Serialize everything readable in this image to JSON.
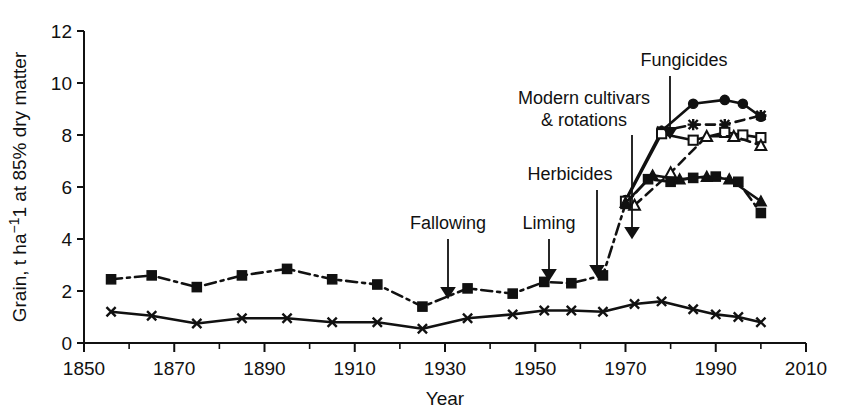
{
  "chart_data": {
    "type": "line",
    "title": "",
    "xlabel": "Year",
    "ylabel": "Grain, t ha−1 at 85% dry matter",
    "xlim": [
      1850,
      2010
    ],
    "ylim": [
      0,
      12
    ],
    "xticks": [
      1850,
      1870,
      1890,
      1910,
      1930,
      1950,
      1970,
      1990,
      2010
    ],
    "xtick_labels": [
      "1850",
      "1870",
      "1890",
      "1910",
      "1930",
      "1950",
      "1970",
      "1990",
      "2010"
    ],
    "xtick_minor_step": 10,
    "yticks": [
      0,
      2,
      4,
      6,
      8,
      10,
      12
    ],
    "ytick_labels": [
      "0",
      "2",
      "4",
      "6",
      "8",
      "10",
      "12"
    ],
    "grid": false,
    "legend": "none",
    "series": [
      {
        "name": "fym-treatment",
        "marker": "filled-square",
        "linestyle": "dashdot",
        "points": [
          [
            1856,
            2.45
          ],
          [
            1865,
            2.6
          ],
          [
            1875,
            2.15
          ],
          [
            1885,
            2.6
          ],
          [
            1895,
            2.85
          ],
          [
            1905,
            2.45
          ],
          [
            1915,
            2.25
          ],
          [
            1925,
            1.4
          ],
          [
            1935,
            2.1
          ],
          [
            1945,
            1.9
          ],
          [
            1952,
            2.35
          ],
          [
            1958,
            2.3
          ],
          [
            1965,
            2.6
          ],
          [
            1970,
            5.35
          ],
          [
            1975,
            6.3
          ],
          [
            1980,
            6.2
          ],
          [
            1985,
            6.35
          ],
          [
            1990,
            6.4
          ],
          [
            1995,
            6.2
          ],
          [
            2000,
            5.0
          ]
        ]
      },
      {
        "name": "unfertilized-control",
        "marker": "cross-x",
        "linestyle": "solid",
        "points": [
          [
            1856,
            1.2
          ],
          [
            1865,
            1.05
          ],
          [
            1875,
            0.75
          ],
          [
            1885,
            0.95
          ],
          [
            1895,
            0.95
          ],
          [
            1905,
            0.8
          ],
          [
            1915,
            0.8
          ],
          [
            1925,
            0.55
          ],
          [
            1935,
            0.95
          ],
          [
            1945,
            1.1
          ],
          [
            1952,
            1.25
          ],
          [
            1958,
            1.25
          ],
          [
            1965,
            1.2
          ],
          [
            1972,
            1.5
          ],
          [
            1978,
            1.6
          ],
          [
            1985,
            1.3
          ],
          [
            1990,
            1.1
          ],
          [
            1995,
            1.0
          ],
          [
            2000,
            0.8
          ]
        ]
      },
      {
        "name": "modern-cultivars-fungicide-top",
        "marker": "filled-circle",
        "linestyle": "solid",
        "points": [
          [
            1970,
            5.5
          ],
          [
            1978,
            8.15
          ],
          [
            1985,
            9.2
          ],
          [
            1992,
            9.35
          ],
          [
            1996,
            9.2
          ],
          [
            2000,
            8.7
          ]
        ]
      },
      {
        "name": "modern-cultivars-fungicide-alt",
        "marker": "asterisk",
        "linestyle": "dashed",
        "points": [
          [
            1978,
            8.15
          ],
          [
            1985,
            8.4
          ],
          [
            1992,
            8.4
          ],
          [
            2000,
            8.75
          ]
        ]
      },
      {
        "name": "modern-cultivars-no-fungicide",
        "marker": "open-square",
        "linestyle": "solid",
        "points": [
          [
            1970,
            5.45
          ],
          [
            1978,
            8.05
          ],
          [
            1985,
            7.8
          ],
          [
            1992,
            8.1
          ],
          [
            1996,
            8.0
          ],
          [
            2000,
            7.9
          ]
        ]
      },
      {
        "name": "modern-cultivars-no-fungicide-alt",
        "marker": "open-triangle",
        "linestyle": "dashed",
        "points": [
          [
            1972,
            5.3
          ],
          [
            1980,
            6.55
          ],
          [
            1988,
            7.95
          ],
          [
            1994,
            7.95
          ],
          [
            2000,
            7.6
          ]
        ]
      },
      {
        "name": "older-cultivars",
        "marker": "filled-triangle",
        "linestyle": "solid",
        "points": [
          [
            1970,
            5.4
          ],
          [
            1976,
            6.45
          ],
          [
            1982,
            6.3
          ],
          [
            1988,
            6.4
          ],
          [
            1993,
            6.3
          ],
          [
            2000,
            5.45
          ]
        ]
      }
    ],
    "annotations": [
      {
        "label": "Fallowing",
        "text_x": 448,
        "text_y": 229,
        "arrow_x": 448,
        "arrow_y0": 239,
        "arrow_y1": 300
      },
      {
        "label": "Liming",
        "text_x": 549,
        "text_y": 229,
        "arrow_x": 549,
        "arrow_y0": 239,
        "arrow_y1": 282
      },
      {
        "label": "Herbicides",
        "text_x": 570,
        "text_y": 180,
        "arrow_x": 597,
        "arrow_y0": 190,
        "arrow_y1": 278
      },
      {
        "label": "Modern cultivars",
        "text_x": 584,
        "text_y": 104,
        "arrow_x": 632,
        "arrow_y0": 135,
        "arrow_y1": 240
      },
      {
        "label": "& rotations",
        "text_x": 584,
        "text_y": 126,
        "arrow_x": 0,
        "arrow_y0": 0,
        "arrow_y1": 0
      },
      {
        "label": "Fungicides",
        "text_x": 684,
        "text_y": 66,
        "arrow_x": 670,
        "arrow_y0": 76,
        "arrow_y1": 140
      }
    ]
  }
}
